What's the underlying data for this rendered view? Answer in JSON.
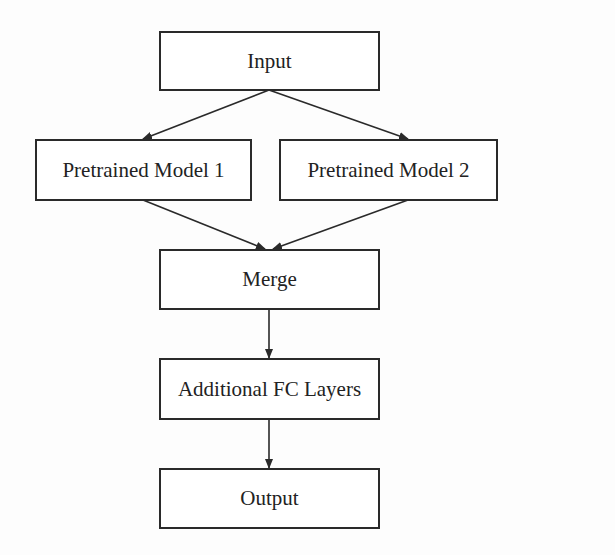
{
  "diagram": {
    "type": "flowchart",
    "nodes": [
      {
        "id": "input",
        "label": "Input"
      },
      {
        "id": "pm1",
        "label": "Pretrained Model 1"
      },
      {
        "id": "pm2",
        "label": "Pretrained Model 2"
      },
      {
        "id": "merge",
        "label": "Merge"
      },
      {
        "id": "fc",
        "label": "Additional FC Layers"
      },
      {
        "id": "output",
        "label": "Output"
      }
    ],
    "edges": [
      {
        "from": "input",
        "to": "pm1"
      },
      {
        "from": "input",
        "to": "pm2"
      },
      {
        "from": "pm1",
        "to": "merge"
      },
      {
        "from": "pm2",
        "to": "merge"
      },
      {
        "from": "merge",
        "to": "fc"
      },
      {
        "from": "fc",
        "to": "output"
      }
    ],
    "colors": {
      "stroke": "#2a2a2a",
      "text": "#222222",
      "background": "#ffffff"
    }
  }
}
